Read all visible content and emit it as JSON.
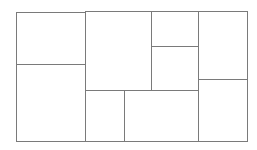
{
  "diagram": {
    "type": "rectangle-tiling",
    "line_color": "#7a7a7a",
    "background": "#ffffff",
    "outer_bounds": {
      "x": 16,
      "y": 11,
      "w": 232,
      "h": 131
    },
    "cells": [
      {
        "id": "A",
        "x": 16,
        "y": 12,
        "w": 70,
        "h": 53
      },
      {
        "id": "B",
        "x": 16,
        "y": 64,
        "w": 70,
        "h": 78
      },
      {
        "id": "C",
        "x": 85,
        "y": 11,
        "w": 67,
        "h": 80
      },
      {
        "id": "D",
        "x": 151,
        "y": 11,
        "w": 48,
        "h": 36
      },
      {
        "id": "E",
        "x": 151,
        "y": 46,
        "w": 48,
        "h": 45
      },
      {
        "id": "F",
        "x": 198,
        "y": 11,
        "w": 50,
        "h": 69
      },
      {
        "id": "G",
        "x": 85,
        "y": 90,
        "w": 40,
        "h": 52
      },
      {
        "id": "H",
        "x": 124,
        "y": 90,
        "w": 75,
        "h": 52
      },
      {
        "id": "I",
        "x": 198,
        "y": 79,
        "w": 50,
        "h": 63
      }
    ]
  }
}
